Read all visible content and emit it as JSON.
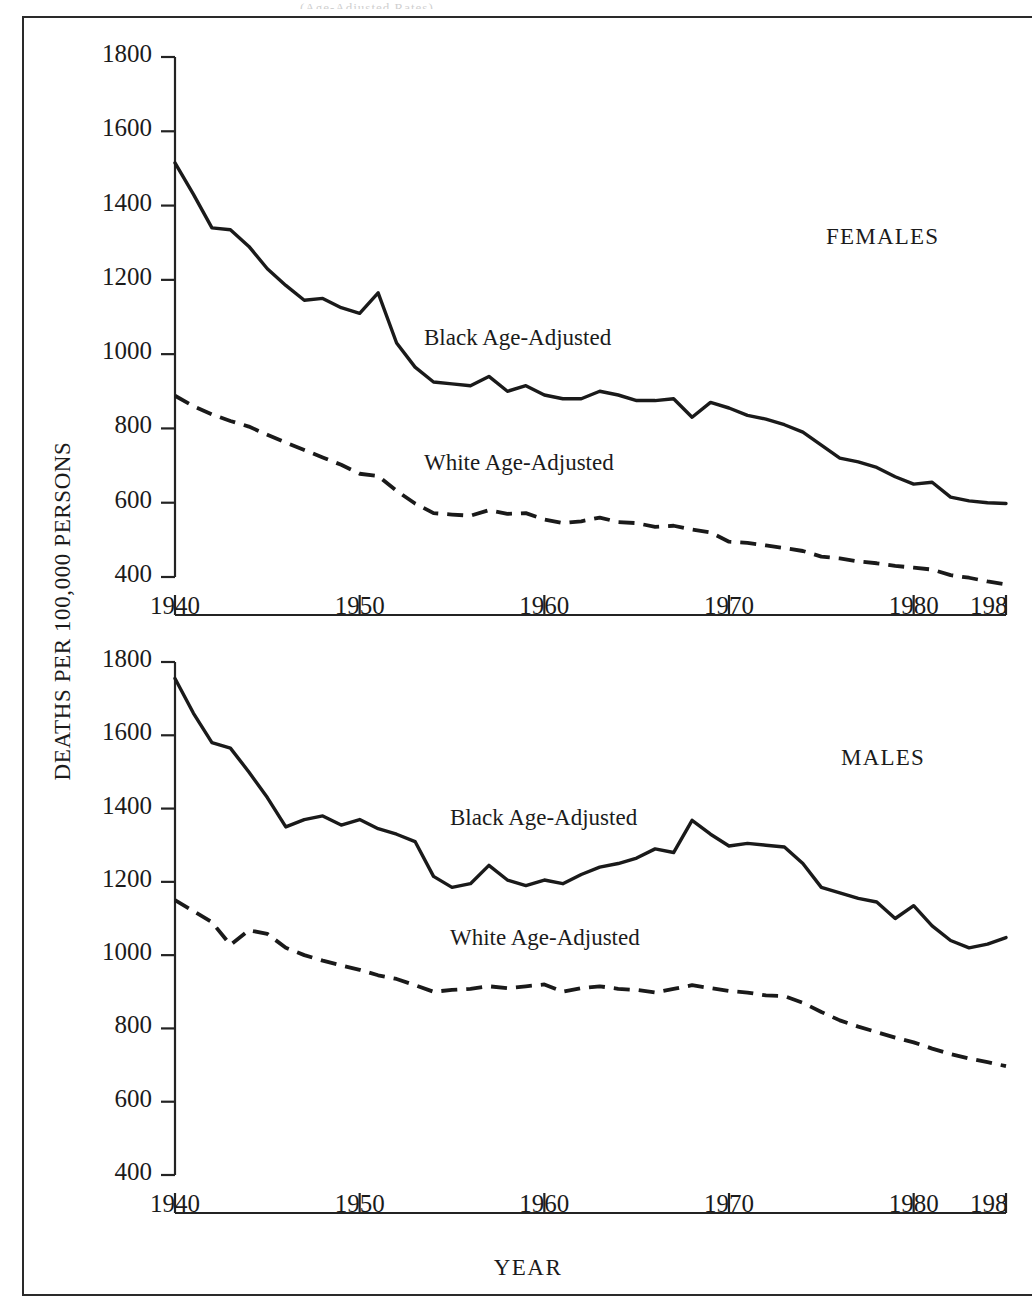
{
  "figure": {
    "y_axis_title": "DEATHS PER 100,000 PERSONS",
    "x_axis_title": "YEAR",
    "scan_artifact_text": "(Age-Adjusted Rates)"
  },
  "panels": [
    {
      "id": "females",
      "title": "FEMALES",
      "black_label": "Black Age-Adjusted",
      "white_label": "White Age-Adjusted"
    },
    {
      "id": "males",
      "title": "MALES",
      "black_label": "Black Age-Adjusted",
      "white_label": "White Age-Adjusted"
    }
  ],
  "axes": {
    "y_ticks": [
      400,
      600,
      800,
      1000,
      1200,
      1400,
      1600,
      1800
    ],
    "y_tick_labels": [
      "400",
      "600",
      "800",
      "1000",
      "1200",
      "1400",
      "1600",
      "1800"
    ],
    "x_ticks": [
      1940,
      1950,
      1960,
      1970,
      1980,
      1985
    ],
    "x_tick_labels": [
      "1940",
      "1950",
      "1960",
      "1970",
      "1980",
      "1985"
    ],
    "x_tick_labels_clipped": [
      "1940",
      "1950",
      "1960",
      "1970",
      "1980",
      "198"
    ],
    "ylim": [
      400,
      1800
    ],
    "xlim": [
      1940,
      1985
    ],
    "grid": false
  },
  "chart_data": [
    {
      "type": "line",
      "title": "FEMALES",
      "subtitle": "",
      "xlabel": "YEAR",
      "ylabel": "DEATHS PER 100,000 PERSONS",
      "xlim": [
        1940,
        1985
      ],
      "ylim": [
        400,
        1800
      ],
      "grid": false,
      "legend_position": "inline-annotation",
      "x": [
        1940,
        1941,
        1942,
        1943,
        1944,
        1945,
        1946,
        1947,
        1948,
        1949,
        1950,
        1951,
        1952,
        1953,
        1954,
        1955,
        1956,
        1957,
        1958,
        1959,
        1960,
        1961,
        1962,
        1963,
        1964,
        1965,
        1966,
        1967,
        1968,
        1969,
        1970,
        1971,
        1972,
        1973,
        1974,
        1975,
        1976,
        1977,
        1978,
        1979,
        1980,
        1981,
        1982,
        1983,
        1984,
        1985
      ],
      "series": [
        {
          "name": "Black Age-Adjusted",
          "style": "solid",
          "values": [
            1515,
            1430,
            1340,
            1335,
            1290,
            1230,
            1185,
            1145,
            1150,
            1125,
            1110,
            1165,
            1030,
            965,
            925,
            920,
            915,
            940,
            900,
            915,
            890,
            880,
            880,
            900,
            890,
            875,
            875,
            880,
            830,
            870,
            855,
            835,
            825,
            810,
            790,
            755,
            720,
            710,
            695,
            670,
            650,
            655,
            615,
            605,
            600,
            598
          ]
        },
        {
          "name": "White Age-Adjusted",
          "style": "dashed",
          "values": [
            888,
            860,
            838,
            820,
            805,
            783,
            762,
            742,
            722,
            702,
            678,
            672,
            632,
            598,
            572,
            568,
            565,
            580,
            570,
            572,
            555,
            545,
            550,
            560,
            548,
            545,
            535,
            538,
            528,
            520,
            495,
            492,
            485,
            478,
            470,
            455,
            450,
            442,
            437,
            430,
            425,
            420,
            405,
            398,
            388,
            380
          ]
        }
      ]
    },
    {
      "type": "line",
      "title": "MALES",
      "subtitle": "",
      "xlabel": "YEAR",
      "ylabel": "DEATHS PER 100,000 PERSONS",
      "xlim": [
        1940,
        1985
      ],
      "ylim": [
        400,
        1800
      ],
      "grid": false,
      "legend_position": "inline-annotation",
      "x": [
        1940,
        1941,
        1942,
        1943,
        1944,
        1945,
        1946,
        1947,
        1948,
        1949,
        1950,
        1951,
        1952,
        1953,
        1954,
        1955,
        1956,
        1957,
        1958,
        1959,
        1960,
        1961,
        1962,
        1963,
        1964,
        1965,
        1966,
        1967,
        1968,
        1969,
        1970,
        1971,
        1972,
        1973,
        1974,
        1975,
        1976,
        1977,
        1978,
        1979,
        1980,
        1981,
        1982,
        1983,
        1984,
        1985
      ],
      "series": [
        {
          "name": "Black Age-Adjusted",
          "style": "solid",
          "values": [
            1755,
            1660,
            1580,
            1565,
            1500,
            1430,
            1350,
            1370,
            1380,
            1355,
            1370,
            1345,
            1330,
            1310,
            1215,
            1185,
            1195,
            1245,
            1205,
            1190,
            1205,
            1195,
            1220,
            1240,
            1250,
            1265,
            1290,
            1280,
            1368,
            1330,
            1298,
            1305,
            1300,
            1295,
            1250,
            1185,
            1170,
            1155,
            1145,
            1100,
            1135,
            1080,
            1040,
            1020,
            1030,
            1048
          ]
        },
        {
          "name": "White Age-Adjusted",
          "style": "dashed",
          "values": [
            1150,
            1120,
            1090,
            1028,
            1068,
            1058,
            1020,
            1000,
            985,
            972,
            960,
            945,
            935,
            918,
            900,
            905,
            908,
            915,
            910,
            915,
            920,
            900,
            910,
            915,
            908,
            905,
            898,
            908,
            918,
            910,
            902,
            898,
            890,
            888,
            870,
            845,
            822,
            805,
            790,
            775,
            762,
            745,
            730,
            718,
            708,
            697
          ]
        }
      ]
    }
  ]
}
